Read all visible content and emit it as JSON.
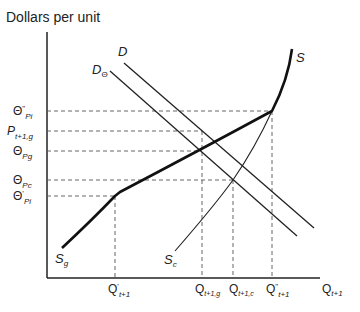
{
  "diagram": {
    "y_axis_label": "Dollars per unit",
    "x_axis_label": {
      "main": "Q",
      "sub": "t+1"
    },
    "curves": {
      "D": {
        "main": "D",
        "sub": ""
      },
      "D_theta": {
        "main": "D",
        "sub": "Θ"
      },
      "S": {
        "main": "S",
        "sub": ""
      },
      "S_g": {
        "main": "S",
        "sub": "g"
      },
      "S_c": {
        "main": "S",
        "sub": "c"
      }
    },
    "y_ticks": [
      {
        "main": "Θ",
        "sup": "\"",
        "sub": "Pi"
      },
      {
        "main": "P",
        "sup": "",
        "sub": "t+1,g"
      },
      {
        "main": "Θ",
        "sup": "",
        "sub": "Pg"
      },
      {
        "main": "Θ",
        "sup": "",
        "sub": "Pc"
      },
      {
        "main": "Θ",
        "sup": "'",
        "sub": "Pi"
      }
    ],
    "x_ticks": [
      {
        "main": "Q",
        "sup": "'",
        "sub": "t+1"
      },
      {
        "main": "Q",
        "sup": "",
        "sub": "t+1,g"
      },
      {
        "main": "Q",
        "sup": "",
        "sub": "t+1,c"
      },
      {
        "main": "Q",
        "sup": "\"",
        "sub": "t+1"
      }
    ],
    "colors": {
      "line": "#222222",
      "dashed": "#555555"
    }
  }
}
